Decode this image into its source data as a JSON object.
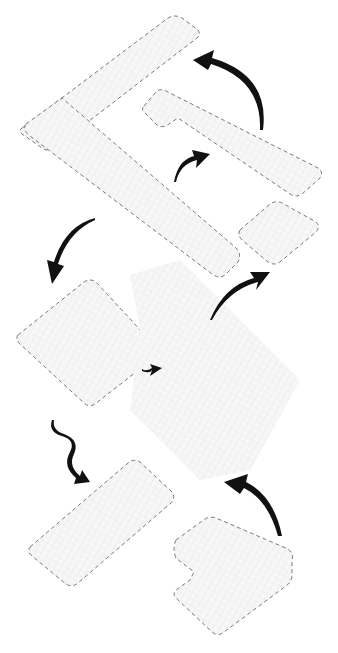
{
  "diagram": {
    "type": "exploded-axonometric",
    "background": "#ffffff",
    "zone_stroke_color": "#7a7a7a",
    "zone_fill_color": "#f6f6f6",
    "arrow_color": "#111111",
    "zones": [
      {
        "id": "long-strip-top",
        "style": "dashed"
      },
      {
        "id": "diagonal-band",
        "style": "dashed"
      },
      {
        "id": "hook-band",
        "style": "dashed"
      },
      {
        "id": "small-tile-right",
        "style": "dashed"
      },
      {
        "id": "square-tile-left",
        "style": "dashed"
      },
      {
        "id": "central-block",
        "style": "undashed"
      },
      {
        "id": "lower-left-strip",
        "style": "dashed"
      },
      {
        "id": "lower-right-notched",
        "style": "dashed"
      }
    ],
    "arrows": [
      {
        "id": "arrow-top-right-to-strip",
        "direction": "curving-left"
      },
      {
        "id": "arrow-mid-to-hook",
        "direction": "up-right"
      },
      {
        "id": "arrow-left-down",
        "direction": "down"
      },
      {
        "id": "arrow-center-to-small-tile",
        "direction": "up-right"
      },
      {
        "id": "arrow-square-to-center",
        "direction": "right"
      },
      {
        "id": "arrow-squiggle-down",
        "direction": "down-right"
      },
      {
        "id": "arrow-bottom-right-up",
        "direction": "up-left"
      }
    ]
  }
}
